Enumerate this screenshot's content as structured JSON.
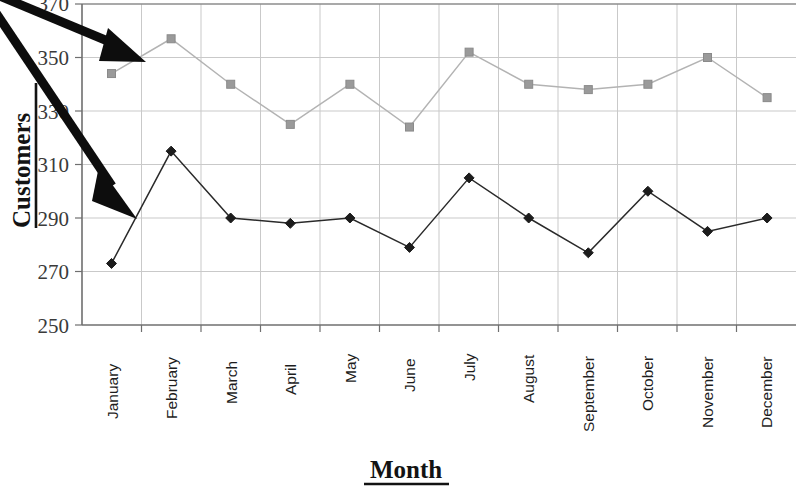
{
  "chart_data": {
    "type": "line",
    "title": "",
    "xlabel": "Month",
    "ylabel": "Customers",
    "grid": true,
    "legend": "none",
    "ylim": [
      250,
      370
    ],
    "yticks": [
      250,
      270,
      290,
      310,
      330,
      350,
      370
    ],
    "categories": [
      "January",
      "February",
      "March",
      "April",
      "May",
      "June",
      "July",
      "August",
      "September",
      "October",
      "November",
      "December"
    ],
    "series": [
      {
        "name": "upper-series",
        "marker": "square",
        "color": "#9a9a9a",
        "values": [
          344,
          357,
          340,
          325,
          340,
          324,
          352,
          340,
          338,
          340,
          350,
          335
        ]
      },
      {
        "name": "lower-series",
        "marker": "diamond",
        "color": "#1c1c1c",
        "values": [
          273,
          315,
          290,
          288,
          290,
          279,
          305,
          290,
          277,
          300,
          285,
          290
        ]
      }
    ],
    "annotations": [
      {
        "name": "arrow-to-upper-series",
        "shape": "arrow",
        "from": [
          0,
          0
        ],
        "to": [
          137,
          57
        ]
      },
      {
        "name": "arrow-to-lower-series",
        "shape": "arrow",
        "from": [
          0,
          15
        ],
        "to": [
          130,
          208
        ]
      }
    ]
  },
  "axis": {
    "y_title": "Customers",
    "x_title": "Month",
    "y_tick_labels": [
      "370",
      "350",
      "330",
      "310",
      "290",
      "270",
      "250"
    ],
    "x_tick_labels": [
      "January",
      "February",
      "March",
      "April",
      "May",
      "June",
      "July",
      "August",
      "September",
      "October",
      "November",
      "December"
    ]
  }
}
